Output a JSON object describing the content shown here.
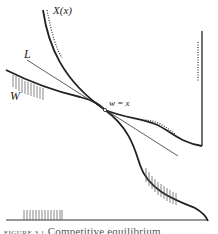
{
  "figure": {
    "labels": {
      "X": "X(x)",
      "L": "L",
      "W": "W",
      "intersection": "w = x"
    },
    "caption": {
      "number": "FIGURE 3.1",
      "text": "Competitive equilibrium"
    },
    "colors": {
      "ink": "#222222",
      "hatch": "#555555",
      "background": "#ffffff"
    }
  },
  "diagram_elements": [
    {
      "id": "X-curve",
      "description": "Steep curve X(x) descending from top-left through intersection, then flattening and dropping to bottom-right corner",
      "style": "thick solid"
    },
    {
      "id": "W-curve",
      "description": "Curve W from left descending through intersection, wavy to right, ending in vertical line at right edge",
      "style": "thick solid"
    },
    {
      "id": "L-line",
      "description": "Straight line L through intersection",
      "style": "thin solid"
    },
    {
      "id": "dotted-segments",
      "description": "Dotted lines alongside X near top, W near right, and vertical right edge",
      "style": "dotted"
    },
    {
      "id": "hatching",
      "description": "Vertical hatch marks under W on left, under X curve lower-right, and on baseline lower-left",
      "style": "thin vertical lines"
    },
    {
      "id": "baseline",
      "description": "Horizontal axis line at bottom",
      "style": "thin solid"
    }
  ]
}
